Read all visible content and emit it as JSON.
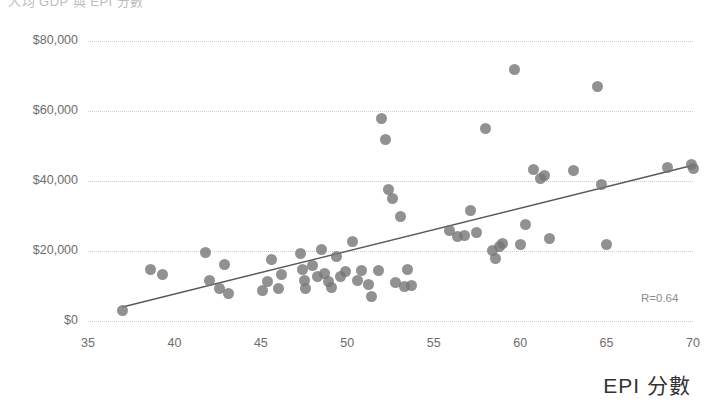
{
  "chart_data": {
    "type": "scatter",
    "title": "人均 GDP 與 EPI 分數",
    "xlabel": "EPI 分數",
    "ylabel": "",
    "xlim": [
      35,
      70
    ],
    "ylim": [
      0,
      80000
    ],
    "xticks": [
      35,
      40,
      45,
      50,
      55,
      60,
      65,
      70
    ],
    "xtick_labels": [
      "35",
      "40",
      "45",
      "50",
      "55",
      "60",
      "65",
      "70"
    ],
    "yticks": [
      0,
      20000,
      40000,
      60000,
      80000
    ],
    "ytick_labels": [
      "$0",
      "$20,000",
      "$40,000",
      "$60,000",
      "$80,000"
    ],
    "grid": "horizontal-dotted",
    "legend": null,
    "annotations": [
      {
        "text": "R=0.64",
        "x": 68.5,
        "y": 2500
      }
    ],
    "marker_color": "#767676",
    "gridline_color": "#cfc6e0",
    "trendline_color": "#595959",
    "trendline": {
      "x0": 37.0,
      "y0": 4000,
      "x1": 70.0,
      "y1": 44500,
      "r": 0.64
    },
    "points": [
      [
        37.0,
        3000
      ],
      [
        38.6,
        14800
      ],
      [
        39.3,
        13300
      ],
      [
        41.8,
        19500
      ],
      [
        42.0,
        11500
      ],
      [
        42.6,
        9200
      ],
      [
        42.9,
        16200
      ],
      [
        43.1,
        7800
      ],
      [
        45.1,
        8600
      ],
      [
        45.4,
        11200
      ],
      [
        45.6,
        17500
      ],
      [
        46.0,
        9400
      ],
      [
        46.2,
        13400
      ],
      [
        47.3,
        19300
      ],
      [
        47.4,
        14800
      ],
      [
        47.5,
        11700
      ],
      [
        47.6,
        9300
      ],
      [
        48.0,
        15900
      ],
      [
        48.3,
        12600
      ],
      [
        48.5,
        20400
      ],
      [
        48.7,
        13700
      ],
      [
        48.9,
        11300
      ],
      [
        49.1,
        9500
      ],
      [
        49.4,
        18500
      ],
      [
        49.6,
        12800
      ],
      [
        49.9,
        14100
      ],
      [
        50.3,
        22600
      ],
      [
        50.6,
        11600
      ],
      [
        50.8,
        14500
      ],
      [
        51.2,
        10300
      ],
      [
        51.4,
        7100
      ],
      [
        51.8,
        14300
      ],
      [
        52.0,
        57900
      ],
      [
        52.2,
        52000
      ],
      [
        52.4,
        37500
      ],
      [
        52.6,
        34900
      ],
      [
        52.8,
        11100
      ],
      [
        53.1,
        29900
      ],
      [
        53.3,
        9900
      ],
      [
        53.5,
        14700
      ],
      [
        53.7,
        10100
      ],
      [
        55.9,
        25800
      ],
      [
        56.4,
        24200
      ],
      [
        56.8,
        24400
      ],
      [
        57.1,
        31500
      ],
      [
        57.5,
        25400
      ],
      [
        58.0,
        55100
      ],
      [
        58.4,
        20200
      ],
      [
        58.6,
        17800
      ],
      [
        58.8,
        21400
      ],
      [
        59.0,
        22100
      ],
      [
        59.7,
        71800
      ],
      [
        60.0,
        22000
      ],
      [
        60.3,
        27600
      ],
      [
        60.8,
        43200
      ],
      [
        61.2,
        40800
      ],
      [
        61.4,
        41600
      ],
      [
        61.7,
        23500
      ],
      [
        63.1,
        43100
      ],
      [
        64.5,
        67000
      ],
      [
        64.7,
        38900
      ],
      [
        65.0,
        21800
      ],
      [
        68.5,
        43800
      ],
      [
        69.9,
        44600
      ],
      [
        70.0,
        43600
      ]
    ]
  }
}
